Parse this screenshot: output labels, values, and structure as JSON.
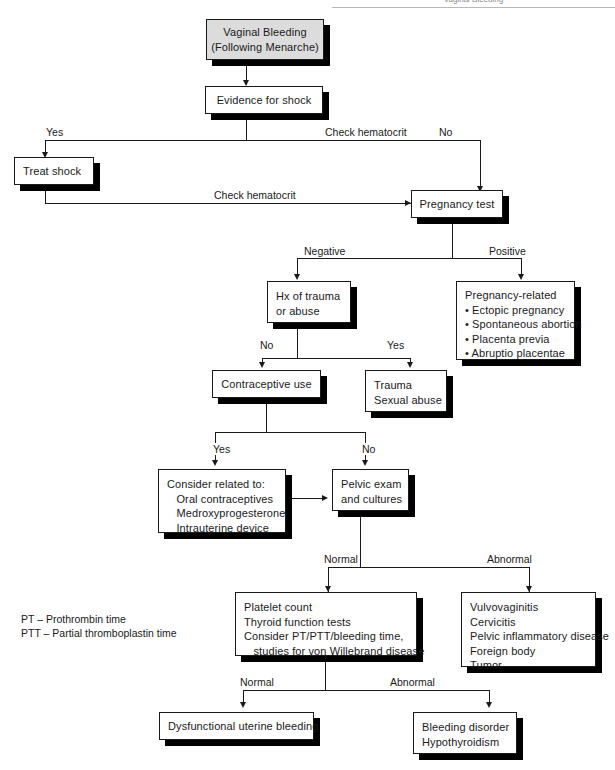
{
  "page": {
    "cropped_header": "Vaginal Bleeding"
  },
  "nodes": {
    "start": {
      "label": "Vaginal Bleeding\n(Following Menarche)"
    },
    "shock": {
      "label": "Evidence for shock"
    },
    "treat_shock": {
      "label": "Treat shock"
    },
    "pregnancy_test": {
      "label": "Pregnancy test"
    },
    "hx_trauma": {
      "label": "Hx of trauma\nor abuse"
    },
    "pregnancy_related": {
      "label": "Pregnancy-related\n• Ectopic pregnancy\n• Spontaneous abortion\n• Placenta previa\n• Abruptio placentae"
    },
    "contraceptive": {
      "label": "Contraceptive use"
    },
    "trauma": {
      "label": "Trauma\nSexual abuse"
    },
    "consider_related": {
      "label": "Consider related to:\n   Oral contraceptives\n   Medroxyprogesterone\n   Intrauterine device"
    },
    "pelvic_exam": {
      "label": "Pelvic exam\nand cultures"
    },
    "labs": {
      "label": "Platelet count\nThyroid function tests\nConsider PT/PTT/bleeding time,\n   studies for von Willebrand disease"
    },
    "abnormal_exam": {
      "label": "Vulvovaginitis\nCervicitis\nPelvic inflammatory disease\nForeign body\nTumor"
    },
    "dub": {
      "label": "Dysfunctional uterine bleeding"
    },
    "bleeding_disorder": {
      "label": "Bleeding disorder\nHypothyroidism"
    }
  },
  "edge_labels": {
    "shock_yes": "Yes",
    "shock_no": "No",
    "hematocrit_top": "Check hematocrit",
    "hematocrit_bottom": "Check hematocrit",
    "preg_negative": "Negative",
    "preg_positive": "Positive",
    "trauma_no": "No",
    "trauma_yes": "Yes",
    "contraceptive_yes": "Yes",
    "contraceptive_no": "No",
    "pelvic_normal": "Normal",
    "pelvic_abnormal": "Abnormal",
    "labs_normal": "Normal",
    "labs_abnormal": "Abnormal"
  },
  "legend": {
    "line1": "PT – Prothrombin time",
    "line2": "PTT – Partial thromboplastin time"
  },
  "colors": {
    "box_fill": "#ffffff",
    "box_fill_shaded": "#dcdcdc",
    "stroke": "#1a1a1a",
    "shadow": "#000000"
  }
}
